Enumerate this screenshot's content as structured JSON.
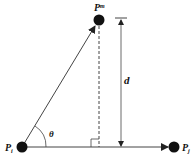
{
  "diagram": {
    "points": {
      "pi": {
        "label": "P",
        "sub": "i"
      },
      "pj": {
        "label": "P",
        "sub": "j"
      },
      "pm": {
        "label": "P",
        "sup": "m"
      }
    },
    "angle_label": "θ",
    "distance_label": "d",
    "colors": {
      "stroke": "#333333",
      "point": "#111111"
    }
  }
}
